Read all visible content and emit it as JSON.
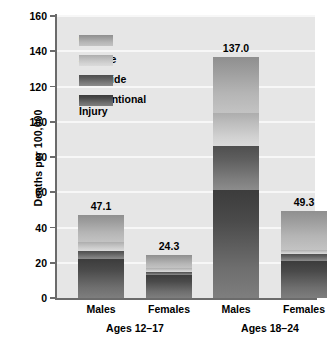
{
  "chart_data": {
    "type": "bar",
    "subtype": "stacked-bar",
    "title": "",
    "xlabel": "",
    "ylabel": "Deaths per 100,000",
    "ylim": [
      0,
      160
    ],
    "yticks": [
      0,
      20,
      40,
      60,
      80,
      100,
      120,
      140,
      160
    ],
    "grid": true,
    "legend_position": "top-left-inside",
    "categories": [
      "Males",
      "Females",
      "Males",
      "Females"
    ],
    "groups": [
      {
        "label": "Ages 12–17",
        "categories": [
          "Males",
          "Females"
        ]
      },
      {
        "label": "Ages 18–24",
        "categories": [
          "Males",
          "Females"
        ]
      }
    ],
    "series": [
      {
        "name": "Unintentional Injury",
        "values": [
          22.0,
          13.0,
          61.5,
          21.0
        ]
      },
      {
        "name": "Homicide",
        "values": [
          4.5,
          2.0,
          24.5,
          4.0
        ]
      },
      {
        "name": "Suicide",
        "values": [
          5.5,
          2.0,
          19.0,
          2.5
        ]
      },
      {
        "name": "Other",
        "values": [
          15.1,
          7.3,
          32.0,
          21.8
        ]
      }
    ],
    "totals": [
      47.1,
      24.3,
      137.0,
      49.3
    ],
    "total_labels": [
      "47.1",
      "24.3",
      "137.0",
      "49.3"
    ],
    "colors": {
      "other": "#a8a8a8",
      "suicide": "#c6c6c6",
      "homicide": "#6a6a6a",
      "unintentional": "#555555",
      "plot_background": "#e6e6e6",
      "gridline": "#f7f7f7",
      "axis": "#6b6b6b",
      "text": "#000000"
    }
  },
  "legend": {
    "items": [
      {
        "label": "Other",
        "key": "other"
      },
      {
        "label": "Suicide",
        "key": "suicide"
      },
      {
        "label": "Homicide",
        "key": "homicide"
      },
      {
        "label": "Unintentional\nInjury",
        "key": "unintentional"
      }
    ]
  },
  "axis": {
    "y_title": "Deaths per 100,000",
    "y_ticks": [
      "0",
      "20",
      "40",
      "60",
      "80",
      "100",
      "120",
      "140",
      "160"
    ]
  },
  "x_labels": {
    "bar_0": "Males",
    "bar_1": "Females",
    "bar_2": "Males",
    "bar_3": "Females",
    "group_0": "Ages 12–17",
    "group_1": "Ages 18–24"
  },
  "bar_values": {
    "bar_0": "47.1",
    "bar_1": "24.3",
    "bar_2": "137.0",
    "bar_3": "49.3"
  }
}
